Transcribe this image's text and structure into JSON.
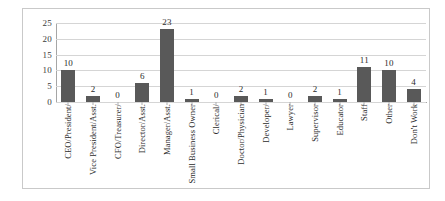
{
  "chart_data": {
    "type": "bar",
    "title": "",
    "xlabel": "",
    "ylabel": "",
    "ylim": [
      0,
      25
    ],
    "yticks": [
      0,
      5,
      10,
      15,
      20,
      25
    ],
    "grid": true,
    "legend": "none",
    "orientation": "vertical",
    "categories": [
      "CEO/President/",
      "Vice President/Asst.",
      "CFO/Treasurer/",
      "Director/Asst.",
      "Manager/Asst.",
      "Small Business Owner",
      "Clerical/",
      "Doctor/Physician",
      "Developer/",
      "Lawyer",
      "Supervisor",
      "Educator",
      "Staff",
      "Other",
      "Don't Work"
    ],
    "values": [
      10,
      2,
      0,
      6,
      23,
      1,
      0,
      2,
      1,
      0,
      2,
      1,
      11,
      10,
      4
    ],
    "data_labels": [
      "10",
      "2",
      "0",
      "6",
      "23",
      "1",
      "0",
      "2",
      "1",
      "0",
      "2",
      "1",
      "11",
      "10",
      "4"
    ],
    "ytick_labels": [
      "0",
      "5",
      "10",
      "15",
      "20",
      "25"
    ],
    "colors": {
      "bar": "#595959",
      "gridline": "#d5d5d5",
      "axis": "#a6a6a6",
      "border": "#c9c9c9",
      "background": "#ffffff",
      "text": "#2b2b2b"
    }
  }
}
